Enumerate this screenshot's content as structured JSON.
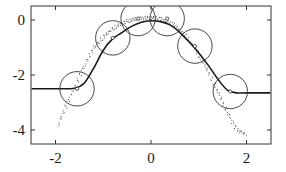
{
  "chart_data": {
    "type": "scatter",
    "title": "",
    "xlabel": "",
    "ylabel": "",
    "xlim": [
      -2.5,
      2.5
    ],
    "ylim": [
      -4.5,
      0.5
    ],
    "xticks": [
      -2,
      0,
      2
    ],
    "yticks": [
      0,
      -2,
      -4
    ],
    "xtick_labels": [
      "-2",
      "0",
      "2"
    ],
    "ytick_labels": [
      "0",
      "-2",
      "-4"
    ],
    "grid": false,
    "legend": null,
    "series": [
      {
        "name": "fitted curve",
        "kind": "line",
        "x": [
          -2.5,
          -2.0,
          -1.6,
          -1.4,
          -1.2,
          -1.0,
          -0.8,
          -0.6,
          -0.4,
          -0.2,
          0.0,
          0.2,
          0.4,
          0.6,
          0.8,
          1.0,
          1.2,
          1.4,
          1.6,
          1.8,
          2.0,
          2.5
        ],
        "y": [
          -2.5,
          -2.5,
          -2.48,
          -2.3,
          -1.75,
          -1.1,
          -0.68,
          -0.45,
          -0.22,
          -0.08,
          -0.03,
          -0.06,
          -0.18,
          -0.45,
          -0.8,
          -1.2,
          -1.65,
          -2.15,
          -2.55,
          -2.65,
          -2.65,
          -2.65
        ]
      },
      {
        "name": "sample points",
        "kind": "scatter",
        "x": [
          -1.95,
          -1.9,
          -1.85,
          -1.8,
          -1.75,
          -1.7,
          -1.65,
          -1.6,
          -1.55,
          -1.5,
          -1.45,
          -1.4,
          -1.35,
          -1.3,
          -1.25,
          -1.2,
          -1.15,
          -1.1,
          -1.05,
          -1.0,
          -0.95,
          -0.9,
          -0.85,
          -0.8,
          -0.75,
          -0.7,
          -0.65,
          -0.6,
          -0.55,
          -0.5,
          -0.45,
          -0.4,
          -0.35,
          -0.3,
          -0.25,
          -0.2,
          -0.15,
          -0.1,
          -0.05,
          0.0,
          0.05,
          0.1,
          0.15,
          0.2,
          0.25,
          0.3,
          0.35,
          0.4,
          0.45,
          0.5,
          0.55,
          0.6,
          0.65,
          0.7,
          0.75,
          0.8,
          0.85,
          0.9,
          0.95,
          1.0,
          1.05,
          1.1,
          1.15,
          1.2,
          1.25,
          1.3,
          1.35,
          1.4,
          1.45,
          1.5,
          1.55,
          1.6,
          1.65,
          1.7,
          1.75,
          1.8,
          1.85,
          1.9,
          1.95
        ],
        "y": [
          -3.85,
          -3.6,
          -3.4,
          -3.2,
          -3.0,
          -2.8,
          -2.6,
          -2.45,
          -2.25,
          -2.05,
          -1.85,
          -1.7,
          -1.5,
          -1.35,
          -1.2,
          -1.05,
          -0.95,
          -0.85,
          -0.75,
          -0.65,
          -0.58,
          -0.5,
          -0.42,
          -0.36,
          -0.3,
          -0.25,
          -0.2,
          -0.16,
          -0.12,
          -0.09,
          -0.06,
          -0.04,
          -0.02,
          -0.01,
          0.0,
          0.01,
          0.02,
          0.02,
          0.02,
          0.02,
          0.02,
          0.01,
          0.0,
          -0.02,
          -0.05,
          -0.08,
          -0.12,
          -0.17,
          -0.22,
          -0.28,
          -0.35,
          -0.43,
          -0.52,
          -0.62,
          -0.72,
          -0.83,
          -0.95,
          -1.08,
          -1.22,
          -1.37,
          -1.52,
          -1.68,
          -1.85,
          -2.02,
          -2.2,
          -2.38,
          -2.56,
          -2.74,
          -2.92,
          -3.1,
          -3.28,
          -3.46,
          -3.64,
          -3.82,
          -3.95,
          -4.05,
          -4.1,
          -4.15,
          -4.2
        ]
      }
    ],
    "annotations": [
      {
        "kind": "circle",
        "cx": -1.55,
        "cy": -2.5,
        "r_data_x": 0.36
      },
      {
        "kind": "circle",
        "cx": -0.8,
        "cy": -0.65,
        "r_data_x": 0.36
      },
      {
        "kind": "circle",
        "cx": -0.27,
        "cy": 0.05,
        "r_data_x": 0.36
      },
      {
        "kind": "circle",
        "cx": 0.34,
        "cy": 0.05,
        "r_data_x": 0.36
      },
      {
        "kind": "circle",
        "cx": 0.92,
        "cy": -0.95,
        "r_data_x": 0.36
      },
      {
        "kind": "circle",
        "cx": 1.66,
        "cy": -2.6,
        "r_data_x": 0.36
      }
    ]
  },
  "colors": {
    "axis": "#333333",
    "line": "#1a1a1a",
    "points": "#444444",
    "circles": "#333333",
    "background": "#ffffff"
  }
}
